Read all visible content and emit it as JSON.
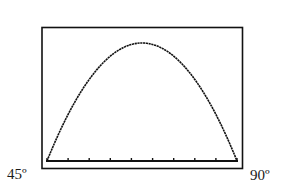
{
  "chart_data": {
    "type": "line",
    "title": "",
    "xlabel": "",
    "ylabel": "",
    "x_tick_labels": {
      "left": "45º",
      "right": "90º"
    },
    "xlim": [
      45,
      90
    ],
    "ylim": [
      0,
      1
    ],
    "grid": false,
    "legend": null,
    "tick_count": 10,
    "series": [
      {
        "name": "curve",
        "shape": "parabola (inverted)",
        "x": [
          45,
          47.5,
          50,
          52.5,
          55,
          57.5,
          60,
          62.5,
          65,
          67.5,
          70,
          72.5,
          75,
          77.5,
          80,
          82.5,
          85,
          87.5,
          90
        ],
        "y": [
          0,
          0.197,
          0.374,
          0.529,
          0.664,
          0.778,
          0.871,
          0.943,
          0.994,
          1.0,
          0.994,
          0.943,
          0.871,
          0.778,
          0.664,
          0.529,
          0.374,
          0.197,
          0
        ]
      }
    ]
  },
  "labels": {
    "left": "45º",
    "right": "90º"
  },
  "style": {
    "line_color": "#111111",
    "frame_color": "#111111",
    "background": "#ffffff"
  }
}
